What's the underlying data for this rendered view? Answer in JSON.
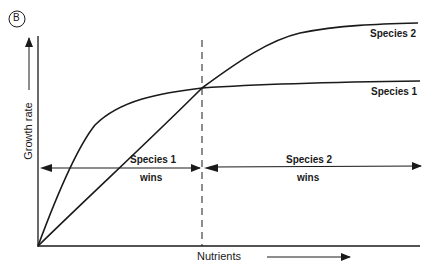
{
  "panel_label": "B",
  "axes": {
    "y_label": "Growth rate",
    "x_label": "Nutrients"
  },
  "curves": [
    {
      "name": "Species 1",
      "label": "Species 1",
      "description": "rises steeply at low nutrients, then plateaus at a lower maximum"
    },
    {
      "name": "Species 2",
      "label": "Species 2",
      "description": "rises more slowly but reaches a higher maximum"
    }
  ],
  "regions": [
    {
      "label_line1": "Species 1",
      "label_line2": "wins",
      "side": "left of crossover"
    },
    {
      "label_line1": "Species 2",
      "label_line2": "wins",
      "side": "right of crossover"
    }
  ],
  "crossover": {
    "style": "dashed vertical line"
  },
  "colors": {
    "ink": "#1a1a1a",
    "background": "#ffffff"
  }
}
